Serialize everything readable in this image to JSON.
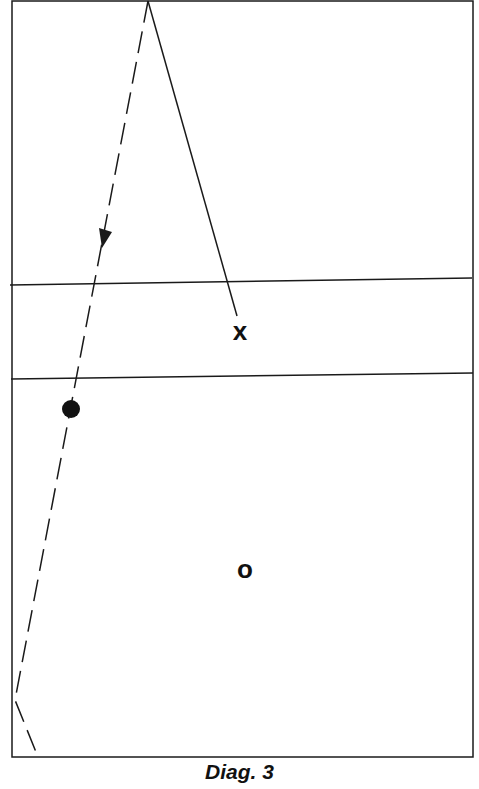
{
  "caption": "Diag. 3",
  "colors": {
    "ink": "#1a1a1a",
    "background": "#ffffff"
  },
  "court": {
    "x1": 12,
    "y1": 1,
    "x2": 473,
    "y2": 757
  },
  "lines": [
    {
      "name": "upper-zone-line",
      "x1": 10,
      "y1": 285,
      "x2": 472,
      "y2": 278
    },
    {
      "name": "lower-zone-line",
      "x1": 11,
      "y1": 379,
      "x2": 473,
      "y2": 373
    }
  ],
  "solid_path": {
    "x1": 148,
    "y1": 1,
    "x2": 237,
    "y2": 316
  },
  "dashed_path": [
    {
      "x": 148,
      "y": 1
    },
    {
      "x": 15,
      "y": 700
    },
    {
      "x": 38,
      "y": 757
    }
  ],
  "arrow": {
    "x": 104,
    "y": 240,
    "direction": "down"
  },
  "markers": {
    "x_player": {
      "label": "x",
      "x": 240,
      "y": 332
    },
    "o_player": {
      "label": "o",
      "x": 245,
      "y": 570
    },
    "ball": {
      "x": 71,
      "y": 409,
      "r": 9
    }
  }
}
